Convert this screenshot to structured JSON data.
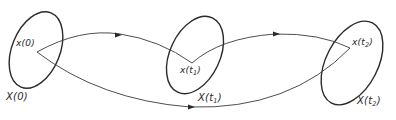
{
  "diagram": {
    "colors": {
      "stroke": "#2a2a2a",
      "background": "#ffffff"
    },
    "sets": [
      {
        "id": "X0",
        "label": "X(0)",
        "point_label": "x(0)"
      },
      {
        "id": "Xt1",
        "label": "X(t",
        "label_sub": "1",
        "label_end": ")",
        "point_label": "x(t",
        "point_sub": "1",
        "point_end": ")"
      },
      {
        "id": "Xt2",
        "label": "X(t",
        "label_sub": "2",
        "label_end": ")",
        "point_label": "x(t",
        "point_sub": "2",
        "point_end": ")"
      }
    ],
    "edges": [
      {
        "from": "x(0)",
        "to": "x(t1)",
        "style": "arrow"
      },
      {
        "from": "x(t1)",
        "to": "x(t2)",
        "style": "arrow"
      },
      {
        "from": "x(0)",
        "to": "x(t2)",
        "style": "arrow"
      }
    ]
  }
}
